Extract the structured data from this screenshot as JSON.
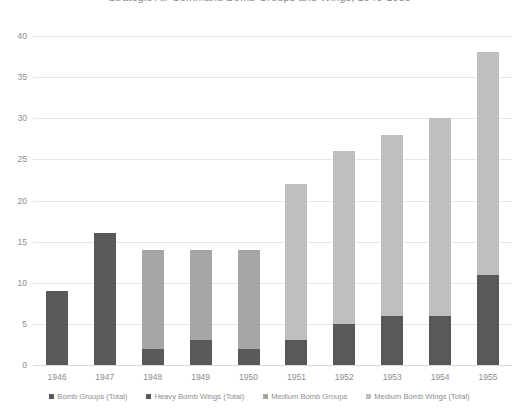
{
  "chart_data": {
    "type": "bar",
    "title": "Strategic Air Command Bomb Groups and Wings, 1946-1955",
    "xlabel": "",
    "ylabel": "",
    "ylim": [
      0,
      40
    ],
    "ytick_step": 5,
    "grid": true,
    "stacked": true,
    "legend_position": "bottom",
    "categories": [
      "1946",
      "1947",
      "1948",
      "1949",
      "1950",
      "1951",
      "1952",
      "1953",
      "1954",
      "1955"
    ],
    "yticks": [
      "0",
      "5",
      "10",
      "15",
      "20",
      "25",
      "30",
      "35",
      "40"
    ],
    "series": [
      {
        "name": "Bomb Groups (Total)",
        "color": "#595959",
        "values": [
          9,
          0,
          0,
          0,
          0,
          0,
          0,
          0,
          0,
          0
        ]
      },
      {
        "name": "Heavy Bomb Wings (Total)",
        "color": "#595959",
        "values": [
          0,
          16,
          2,
          3,
          2,
          3,
          5,
          6,
          6,
          11
        ]
      },
      {
        "name": "Medium Bomb Groups",
        "color": "#a6a6a6",
        "values": [
          0,
          0,
          12,
          11,
          12,
          0,
          0,
          0,
          0,
          0
        ]
      },
      {
        "name": "Medium Bomb Wings (Total)",
        "color": "#bfbfbf",
        "values": [
          0,
          0,
          0,
          0,
          0,
          19,
          21,
          22,
          24,
          27
        ]
      }
    ],
    "totals": [
      9,
      16,
      14,
      14,
      14,
      22,
      26,
      28,
      30,
      38
    ]
  }
}
